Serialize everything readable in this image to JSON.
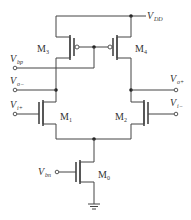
{
  "diagram": {
    "type": "circuit-schematic",
    "title": "",
    "supply": {
      "label": "V",
      "sub": "DD"
    },
    "transistors": [
      {
        "id": "M3",
        "label": "M",
        "sub": "3",
        "type": "pmos"
      },
      {
        "id": "M4",
        "label": "M",
        "sub": "4",
        "type": "pmos"
      },
      {
        "id": "M1",
        "label": "M",
        "sub": "1",
        "type": "nmos"
      },
      {
        "id": "M2",
        "label": "M",
        "sub": "2",
        "type": "nmos"
      },
      {
        "id": "M0",
        "label": "M",
        "sub": "0",
        "type": "nmos"
      }
    ],
    "terminals": {
      "vbp": {
        "label": "V",
        "sub": "bp"
      },
      "vom": {
        "label": "V",
        "sub": "o−"
      },
      "vop": {
        "label": "V",
        "sub": "o+"
      },
      "vip": {
        "label": "V",
        "sub": "i+"
      },
      "vim": {
        "label": "V",
        "sub": "i−"
      },
      "vbn": {
        "label": "V",
        "sub": "bn"
      }
    },
    "colors": {
      "wire": "#444444",
      "text": "#333333",
      "background": "#ffffff"
    }
  }
}
